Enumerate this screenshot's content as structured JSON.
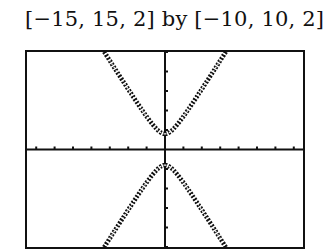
{
  "caption": "[−15, 15, 2] by [−10, 10, 2]",
  "colors": {
    "ink": "#111111",
    "background": "#ffffff"
  },
  "chart_data": {
    "type": "line",
    "title": "[−15, 15, 2] by [−10, 10, 2]",
    "window": {
      "xmin": -15,
      "xmax": 15,
      "xscl": 2,
      "ymin": -10,
      "ymax": 10,
      "yscl": 2
    },
    "xlim": [
      -15,
      15
    ],
    "ylim": [
      -10,
      10
    ],
    "grid": false,
    "axes": true,
    "series": [
      {
        "name": "upper branch",
        "x": [
          -6.2,
          -4,
          -2,
          -1,
          0,
          1,
          2,
          4,
          6.7
        ],
        "y": [
          10,
          6.3,
          3.3,
          2.1,
          1.6,
          2.1,
          3.3,
          6.3,
          10
        ]
      },
      {
        "name": "lower branch",
        "x": [
          -6.5,
          -4,
          -2,
          -1,
          0,
          1,
          2,
          4,
          6.5
        ],
        "y": [
          -10,
          -6.3,
          -3.3,
          -2.1,
          -1.6,
          -2.1,
          -3.3,
          -6.3,
          -10
        ]
      }
    ],
    "xlabel": "",
    "ylabel": ""
  }
}
